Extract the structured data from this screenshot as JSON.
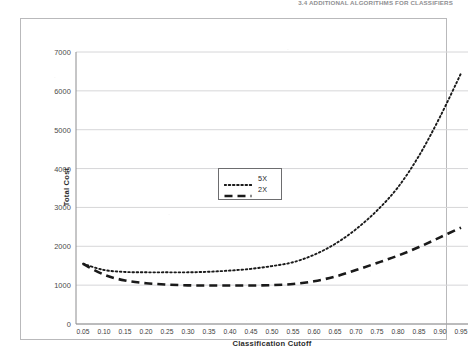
{
  "page": {
    "running_header": "3.4  ADDITIONAL ALGORITHMS FOR CLASSIFIERS"
  },
  "chart_data": {
    "type": "line",
    "title": "",
    "xlabel": "Classification Cutoff",
    "ylabel": "Total Cost",
    "xlim": [
      0.05,
      0.95
    ],
    "ylim": [
      0,
      7000
    ],
    "grid": true,
    "grid_axis": "y",
    "legend_position": "center-left-inside",
    "y_ticks": [
      0,
      1000,
      2000,
      3000,
      4000,
      5000,
      6000,
      7000
    ],
    "y_tick_labels": [
      "0",
      "1000",
      "2000",
      "3000",
      "4000",
      "5000",
      "6000",
      "7000"
    ],
    "x": [
      0.05,
      0.1,
      0.15,
      0.2,
      0.25,
      0.3,
      0.35,
      0.4,
      0.45,
      0.5,
      0.55,
      0.6,
      0.65,
      0.7,
      0.75,
      0.8,
      0.85,
      0.9,
      0.95
    ],
    "x_tick_labels": [
      "0.05",
      "0.10",
      "0.15",
      "0.20",
      "0.25",
      "0.30",
      "0.35",
      "0.40",
      "0.45",
      "0.50",
      "0.55",
      "0.60",
      "0.65",
      "0.70",
      "0.75",
      "0.80",
      "0.85",
      "0.90",
      "0.95"
    ],
    "series": [
      {
        "name": "5X",
        "style": "dotted",
        "color": "#1a1a1a",
        "values": [
          1550,
          1390,
          1340,
          1330,
          1330,
          1330,
          1345,
          1375,
          1420,
          1490,
          1590,
          1780,
          2060,
          2440,
          2920,
          3520,
          4330,
          5330,
          6450
        ]
      },
      {
        "name": "2X",
        "style": "dashed",
        "color": "#1a1a1a",
        "values": [
          1550,
          1270,
          1120,
          1050,
          1015,
          995,
          990,
          990,
          990,
          1000,
          1030,
          1100,
          1220,
          1390,
          1570,
          1760,
          1980,
          2230,
          2480
        ]
      }
    ]
  },
  "legend": {
    "items": [
      {
        "label": "5X",
        "style": "dotted"
      },
      {
        "label": "2X",
        "style": "dashed"
      }
    ]
  }
}
